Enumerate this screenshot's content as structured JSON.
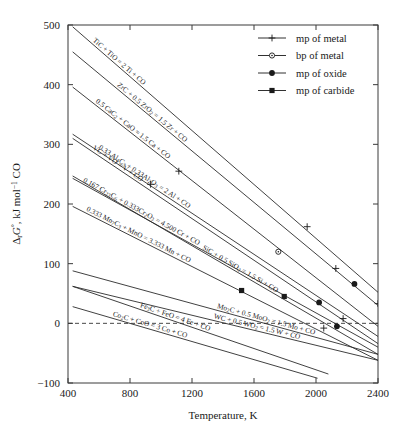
{
  "chart_data": {
    "type": "line",
    "title": "",
    "xlabel": "Temperature, K",
    "ylabel": "ΔᵣG°, kJ mol⁻¹ CO",
    "xlim": [
      400,
      2400
    ],
    "ylim": [
      -100,
      500
    ],
    "xticks": [
      400,
      800,
      1200,
      1600,
      2000,
      2400
    ],
    "yticks": [
      -100,
      0,
      100,
      200,
      300,
      400,
      500
    ],
    "grid": false,
    "legend_position": "top-right",
    "zero_reference_line": 0,
    "legend": [
      {
        "label": "mp of metal",
        "marker": "plus"
      },
      {
        "label": "bp of metal",
        "marker": "open-circle"
      },
      {
        "label": "mp of oxide",
        "marker": "filled-circle"
      },
      {
        "label": "mp of carbide",
        "marker": "filled-square"
      }
    ],
    "series": [
      {
        "name": "TiC + TiO = 2 Ti + CO",
        "label": "TiC + TiO = 2 Ti + CO",
        "x": [
          430,
          2400
        ],
        "y": [
          497,
          52
        ],
        "markers": [
          {
            "x": 1943,
            "y": 162,
            "type": "plus"
          }
        ]
      },
      {
        "name": "ZrC + 0.5 ZrO2 = 1.5 Zr + CO",
        "label": "ZrC + 0.5 ZrO₂ = 1.5 Zr + CO",
        "x": [
          430,
          2400
        ],
        "y": [
          455,
          30
        ],
        "markers": [
          {
            "x": 2128,
            "y": 92,
            "type": "plus"
          },
          {
            "x": 2248,
            "y": 66,
            "type": "filled-circle"
          },
          {
            "x": 2400,
            "y": 33,
            "type": "plus"
          }
        ]
      },
      {
        "name": "0.5 CaC2 + CaO = 1.5 Ca + CO",
        "label": "0.5 CaC₂ + CaO = 1.5 Ca + CO",
        "x": [
          430,
          2400
        ],
        "y": [
          396,
          -5
        ],
        "markers": [
          {
            "x": 1115,
            "y": 255,
            "type": "plus"
          },
          {
            "x": 1757,
            "y": 120,
            "type": "open-circle"
          }
        ]
      },
      {
        "name": "0.33 Al4C3 + 0.33Al2O3 = 2 Al + CO",
        "label": "0.33 Al₄C₃ + 0.33Al₂O₃ = 2 Al + CO",
        "x": [
          430,
          2400
        ],
        "y": [
          317,
          -22
        ],
        "markers": [
          {
            "x": 933,
            "y": 233,
            "type": "plus"
          }
        ]
      },
      {
        "name": "VC + VO = V + CO",
        "label": "VC + VO = V + CO",
        "x": [
          430,
          2400
        ],
        "y": [
          310,
          -34
        ],
        "markers": [
          {
            "x": 2020,
            "y": 35,
            "type": "filled-circle"
          },
          {
            "x": 2175,
            "y": 8,
            "type": "plus"
          }
        ]
      },
      {
        "name": "0.167 Cr23C6 + 0.333Cr2O3 = 4.500 Cr + CO",
        "label": "0.167 Cr₂₃C₆ + 0.333Cr₂O₃ = 4.500 Cr + CO",
        "x": [
          430,
          2400
        ],
        "y": [
          243,
          -40
        ],
        "markers": [
          {
            "x": 1795,
            "y": 45,
            "type": "filled-square"
          },
          {
            "x": 2135,
            "y": -5,
            "type": "filled-circle"
          }
        ]
      },
      {
        "name": "0.333 Mn7C3 + MnO = 3.333 Mn + CO",
        "label": "0.333 Mn₇C₃ + MnO = 3.333 Mn + CO",
        "x": [
          430,
          2400
        ],
        "y": [
          196,
          -62
        ],
        "markers": [
          {
            "x": 1520,
            "y": 55,
            "type": "filled-square"
          },
          {
            "x": 2050,
            "y": -8,
            "type": "plus"
          }
        ]
      },
      {
        "name": "SiC + 0.5 SiO2 = 1.5 Si + CO",
        "label": "SiC + 0.5 SiO₂ = 1.5 Si + CO",
        "x": [
          430,
          2400
        ],
        "y": [
          247,
          -52
        ],
        "markers": []
      },
      {
        "name": "Mo2C + 0.5 MoO2 = 1.5 Mo + CO",
        "label": "Mo₂C + 0.5 MoO₂ = 1.5 Mo + CO",
        "x": [
          430,
          2400
        ],
        "y": [
          88,
          -52
        ],
        "markers": []
      },
      {
        "name": "WC + 0.5 WO2 = 1.5 W + CO",
        "label": "WC + 0.5 WO₂ = 1.5 W + CO",
        "x": [
          430,
          2400
        ],
        "y": [
          62,
          -62
        ],
        "markers": []
      },
      {
        "name": "Fe3C + FeO = 4 Fe + CO",
        "label": "Fe₃C + FeO = 4 Fe + CO",
        "x": [
          430,
          2080
        ],
        "y": [
          62,
          -85
        ],
        "markers": []
      },
      {
        "name": "Co2C + CoO = 3 Co + CO",
        "label": "Co₂C + CoO = 3 Co + CO",
        "x": [
          430,
          2010
        ],
        "y": [
          28,
          -92
        ],
        "markers": []
      }
    ]
  },
  "axes": {
    "x_tick_labels": [
      "400",
      "800",
      "1200",
      "1600",
      "2000",
      "2400"
    ],
    "y_tick_labels": [
      "-100",
      "0",
      "100",
      "200",
      "300",
      "400",
      "500"
    ],
    "x_title": "Temperature, K",
    "y_title_parts": {
      "delta": "Δ",
      "sub_r": "r",
      "g": "G",
      "deg": "°",
      "rest": ", kJ mol",
      "exp": "−1",
      "tail": " CO"
    }
  }
}
